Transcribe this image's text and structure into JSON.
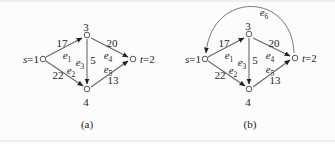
{
  "colors": {
    "line": "#666666",
    "text": "#1f1f1f",
    "node_fill": "#ffffff",
    "node_stroke": "#555555",
    "arrowhead": "#222222",
    "background": "#fcfcfc"
  },
  "panels": [
    {
      "caption": "(a)",
      "nodes": {
        "s": {
          "var": "s",
          "rest": "=1"
        },
        "n3": {
          "label": "3"
        },
        "n4": {
          "label": "4"
        },
        "t": {
          "var": "t",
          "rest": "=2"
        }
      },
      "edges": {
        "e1": {
          "name": "e",
          "sub": "1",
          "weight": "17",
          "from": "s=1",
          "to": "3"
        },
        "e2": {
          "name": "e",
          "sub": "2",
          "weight": "22",
          "from": "s=1",
          "to": "4"
        },
        "e3": {
          "name": "e",
          "sub": "3",
          "weight": "5",
          "from": "3",
          "to": "4"
        },
        "e4": {
          "name": "e",
          "sub": "4",
          "weight": "20",
          "from": "3",
          "to": "t=2"
        },
        "e5": {
          "name": "e",
          "sub": "5",
          "weight": "13",
          "from": "4",
          "to": "t=2"
        }
      }
    },
    {
      "caption": "(b)",
      "nodes": {
        "s": {
          "var": "s",
          "rest": "=1"
        },
        "n3": {
          "label": "3"
        },
        "n4": {
          "label": "4"
        },
        "t": {
          "var": "t",
          "rest": "=2"
        }
      },
      "edges": {
        "e1": {
          "name": "e",
          "sub": "1",
          "weight": "17",
          "from": "s=1",
          "to": "3"
        },
        "e2": {
          "name": "e",
          "sub": "2",
          "weight": "22",
          "from": "s=1",
          "to": "4"
        },
        "e3": {
          "name": "e",
          "sub": "3",
          "weight": "5",
          "from": "3",
          "to": "4"
        },
        "e4": {
          "name": "e",
          "sub": "4",
          "weight": "20",
          "from": "3",
          "to": "t=2"
        },
        "e5": {
          "name": "e",
          "sub": "5",
          "weight": "13",
          "from": "4",
          "to": "t=2"
        },
        "e6": {
          "name": "e",
          "sub": "6",
          "from": "t=2",
          "to": "s=1"
        }
      }
    }
  ]
}
